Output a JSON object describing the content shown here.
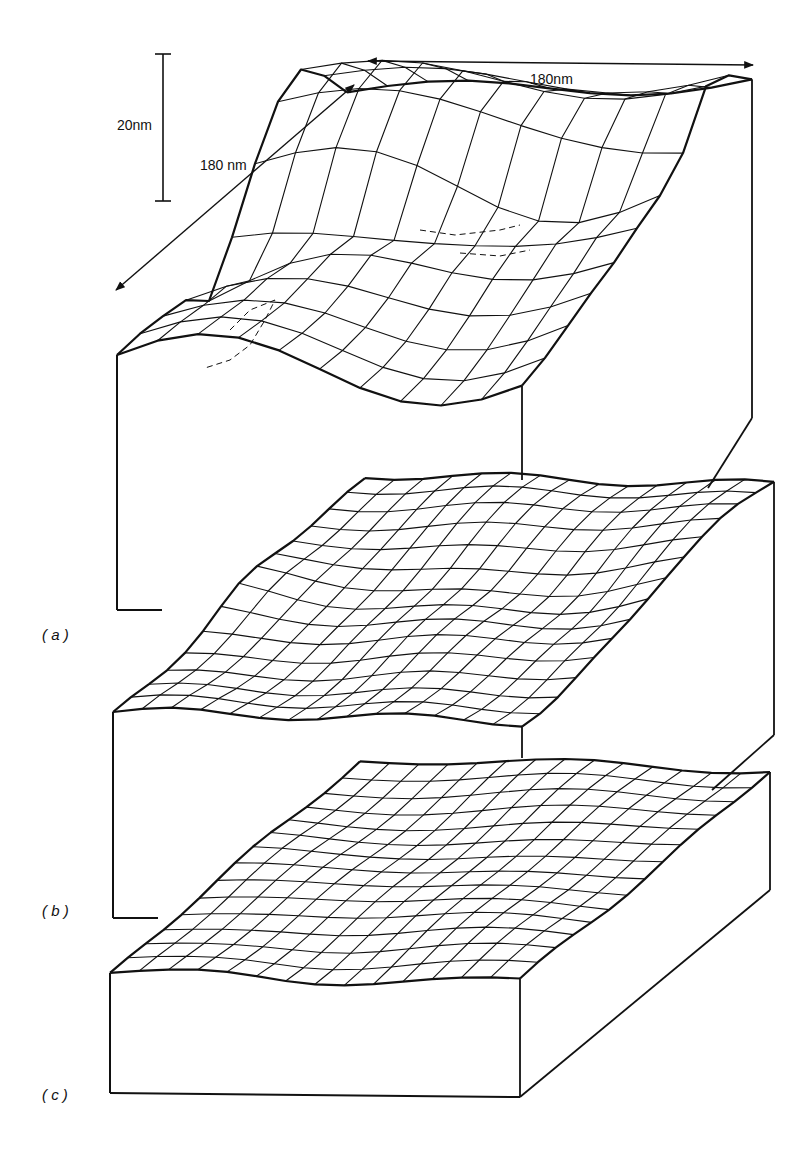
{
  "figure": {
    "type": "3d-wireframe-surface-plots",
    "ink_color": "#111111",
    "background": "#ffffff",
    "scale_bars": {
      "vertical": {
        "label": "20nm",
        "value_nm": 20
      },
      "depth": {
        "label": "180 nm",
        "value_nm": 180
      },
      "width": {
        "label": "180nm",
        "value_nm": 180
      }
    },
    "panels": [
      {
        "id": "a",
        "label": "( a )",
        "relief": "large",
        "description": "Rough surface with deep trench, dashed hidden lines"
      },
      {
        "id": "b",
        "label": "( b )",
        "relief": "medium",
        "description": "Moderately rough surface"
      },
      {
        "id": "c",
        "label": "( c )",
        "relief": "small",
        "description": "Nearly flat surface"
      }
    ]
  }
}
